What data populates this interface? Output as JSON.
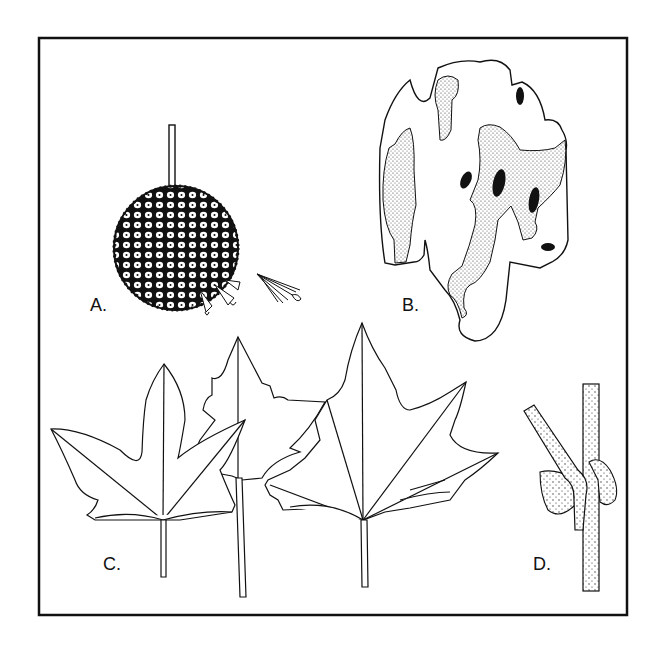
{
  "figure": {
    "panels": [
      {
        "id": "A",
        "label": "A.",
        "subject": "fruit-ball-with-seed"
      },
      {
        "id": "B",
        "label": "B.",
        "subject": "bark"
      },
      {
        "id": "C",
        "label": "C.",
        "subject": "leaves"
      },
      {
        "id": "D",
        "label": "D.",
        "subject": "twig-with-buds"
      }
    ],
    "colors": {
      "ink": "#111111",
      "stipple": "#bdbdbd",
      "background": "#ffffff"
    }
  }
}
